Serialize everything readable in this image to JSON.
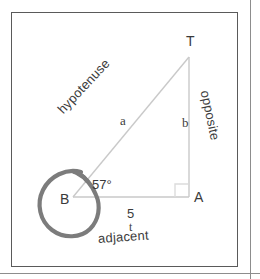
{
  "figure": {
    "vertices": {
      "apex_label": "T",
      "right_angle_label": "A",
      "angle_vertex_label": "B"
    },
    "angle": {
      "value": "57°",
      "at_vertex": "B"
    },
    "sides": {
      "hypotenuse_word": "hypotenuse",
      "hypotenuse_var": "a",
      "opposite_word": "opposite",
      "opposite_var": "b",
      "adjacent_word": "adjacent",
      "adjacent_value": "5",
      "adjacent_unit": "t"
    },
    "markers": {
      "right_angle_marker": "right-angle-square",
      "annotation": "hand-drawn-circle-around-B"
    },
    "colors": {
      "frame_border": "#5a5a5a",
      "triangle_stroke": "#c9c9c9",
      "annotation_circle": "#7c7c7c",
      "text": "#3a3a3a",
      "page_rule": "#8d8d8d",
      "background": "#ffffff"
    }
  }
}
